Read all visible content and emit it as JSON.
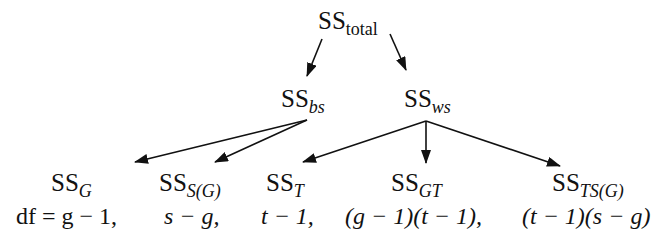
{
  "diagram": {
    "nodes": {
      "total": {
        "base": "SS",
        "sub": "total"
      },
      "bs": {
        "base": "SS",
        "sub": "bs"
      },
      "ws": {
        "base": "SS",
        "sub": "ws"
      },
      "G": {
        "base": "SS",
        "sub": "G",
        "df": "df = g − 1,"
      },
      "SG": {
        "base": "SS",
        "sub": "S(G)",
        "df": "s − g,"
      },
      "T": {
        "base": "SS",
        "sub": "T",
        "df": "t − 1,"
      },
      "GT": {
        "base": "SS",
        "sub": "GT",
        "df": "(g − 1)(t − 1),"
      },
      "TSG": {
        "base": "SS",
        "sub": "TS(G)",
        "df": "(t − 1)(s − g)"
      }
    },
    "edges": [
      {
        "from": "total",
        "to": "bs"
      },
      {
        "from": "total",
        "to": "ws"
      },
      {
        "from": "bs",
        "to": "G"
      },
      {
        "from": "bs",
        "to": "SG"
      },
      {
        "from": "ws",
        "to": "T"
      },
      {
        "from": "ws",
        "to": "GT"
      },
      {
        "from": "ws",
        "to": "TSG"
      }
    ]
  }
}
